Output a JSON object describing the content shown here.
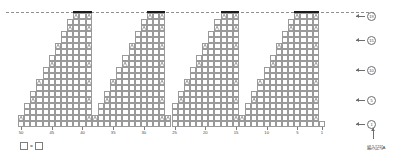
{
  "chart_data": {
    "type": "table",
    "title": "",
    "xlabel": "",
    "ylabel": "",
    "grid": true,
    "columns": 50,
    "rows": 19,
    "x_direction": "right-to-left",
    "x_tick_values": [
      50,
      45,
      40,
      35,
      30,
      25,
      20,
      15,
      10,
      5,
      1
    ],
    "x_tick_labels": [
      "50",
      "45",
      "40",
      "35",
      "30",
      "25",
      "20",
      "15",
      "10",
      "5",
      "1"
    ],
    "y_tick_values": [
      1,
      5,
      10,
      15,
      19
    ],
    "y_tick_labels": [
      "1",
      "5",
      "10",
      "15",
      "19"
    ],
    "motif_count": 4,
    "motif_pitch_stitches": 12,
    "motifs": [
      {
        "index": 1,
        "right_stitch": 50,
        "left_stitch": 38,
        "peak_row": 19
      },
      {
        "index": 2,
        "right_stitch": 38,
        "left_stitch": 26,
        "peak_row": 19
      },
      {
        "index": 3,
        "right_stitch": 26,
        "left_stitch": 14,
        "peak_row": 19
      },
      {
        "index": 4,
        "right_stitch": 14,
        "left_stitch": 1,
        "peak_row": 19
      }
    ],
    "symbols": {
      "plain": "knit-stitch-empty-square",
      "decrease": "paired-decrease",
      "bind_off": "bind-off-bar"
    },
    "series": [
      {
        "name": "row-width-stitches",
        "values": [
          50,
          46,
          46,
          42,
          42,
          38,
          38,
          34,
          34,
          30,
          30,
          26,
          26,
          22,
          22,
          18,
          18,
          14,
          10
        ]
      }
    ],
    "guideline": {
      "style": "dashed",
      "label": ""
    }
  },
  "axes": {
    "bottom": {
      "name": "stitch-count-axis",
      "labels": [
        "50",
        "45",
        "40",
        "35",
        "30",
        "25",
        "20",
        "15",
        "10",
        "5",
        "1"
      ],
      "positions": [
        50,
        45,
        40,
        35,
        30,
        25,
        20,
        15,
        10,
        5,
        1
      ]
    },
    "right": {
      "name": "row-number-axis",
      "labels": [
        "19",
        "15",
        "10",
        "5",
        "1"
      ],
      "rows": [
        19,
        15,
        10,
        5,
        1
      ]
    }
  },
  "legend": {
    "symbol_label": "",
    "equals": "=",
    "meaning_label": "",
    "full_text": "□ = □"
  },
  "annotations": {
    "start_note": "編み記号A"
  },
  "colors": {
    "grid_line": "#9a9a9a",
    "bind_off": "#1b1b1b",
    "background": "#ffffff",
    "text": "#3f3f3f",
    "guide": "#8f8f8f"
  }
}
